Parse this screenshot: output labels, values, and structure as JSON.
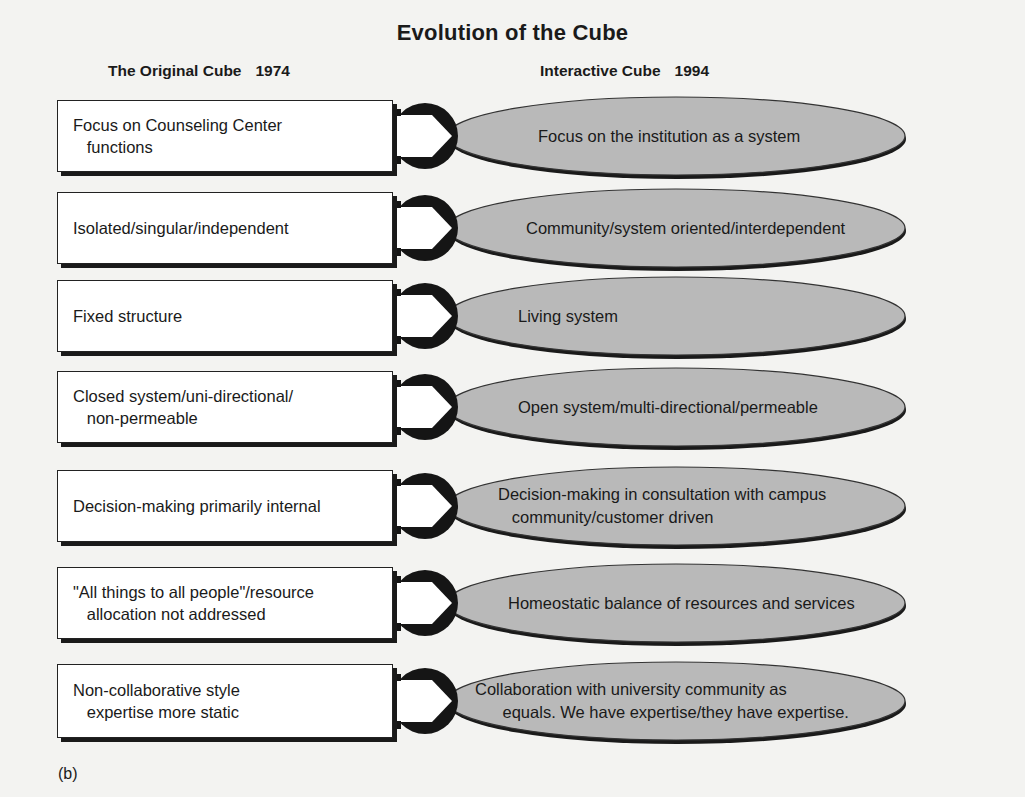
{
  "title": "Evolution of the Cube",
  "left_header": {
    "label": "The Original Cube",
    "year": "1974"
  },
  "right_header": {
    "label": "Interactive Cube",
    "year": "1994"
  },
  "colors": {
    "ellipse_fill": "#b9b9b9",
    "outline": "#1a1a1a",
    "box_fill": "#ffffff",
    "background": "#f3f3f1"
  },
  "rows": [
    {
      "original": "Focus on Counseling Center\n   functions",
      "interactive": "Focus on the institution as a system"
    },
    {
      "original": "Isolated/singular/independent",
      "interactive": "Community/system oriented/interdependent"
    },
    {
      "original": "Fixed structure",
      "interactive": "Living system"
    },
    {
      "original": "Closed system/uni-directional/\n   non-permeable",
      "interactive": "Open system/multi-directional/permeable"
    },
    {
      "original": "Decision-making primarily internal",
      "interactive": "Decision-making in consultation with campus\n   community/customer driven"
    },
    {
      "original": "\"All things to all people\"/resource\n   allocation not addressed",
      "interactive": "Homeostatic balance of resources and services"
    },
    {
      "original": "Non-collaborative style\n   expertise more static",
      "interactive": "Collaboration with university community as\n      equals. We have expertise/they have expertise."
    }
  ],
  "caption": "(b)"
}
